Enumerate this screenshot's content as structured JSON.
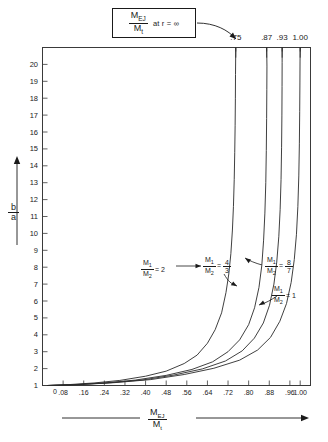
{
  "figure": {
    "callout": {
      "numerator": "M",
      "numerator_sub": "EJ",
      "denominator": "M",
      "denominator_sub": "t",
      "condition": "at  r = ∞"
    },
    "asymptote_labels": [
      ".75",
      ".87",
      ".93",
      "1.00"
    ],
    "y_axis": {
      "label_num": "b",
      "label_den": "a",
      "ticks": [
        "20",
        "19",
        "18",
        "17",
        "16",
        "15",
        "14",
        "13",
        "12",
        "11",
        "10",
        "9",
        "8",
        "7",
        "6",
        "5",
        "4",
        "3",
        "2",
        "1"
      ],
      "origin_label": "0"
    },
    "x_axis": {
      "label_num": "M",
      "label_num_sub": "EJ",
      "label_den": "M",
      "label_den_sub": "t",
      "ticks": [
        ".08",
        ".16",
        ".24",
        ".32",
        ".40",
        ".48",
        ".56",
        ".64",
        ".72",
        ".80",
        ".88",
        ".96",
        "1.00"
      ]
    },
    "annotations": [
      {
        "num": "M",
        "num_sub": "1",
        "den": "M",
        "den_sub": "2",
        "eq": "= 2"
      },
      {
        "num": "M",
        "num_sub": "1",
        "den": "M",
        "den_sub": "2",
        "eq": "= 4/3"
      },
      {
        "num": "M",
        "num_sub": "1",
        "den": "M",
        "den_sub": "2",
        "eq": "= 8/7"
      },
      {
        "num": "M",
        "num_sub": "1",
        "den": "M",
        "den_sub": "2",
        "eq": "= 1"
      }
    ],
    "colors": {
      "ink": "#1a1a1a",
      "background": "#ffffff"
    }
  },
  "chart_data": {
    "type": "line",
    "xlabel": "M_EJ / M_t",
    "ylabel": "b / a",
    "xlim": [
      0,
      1.04
    ],
    "ylim": [
      1,
      21
    ],
    "grid": false,
    "legend": "inline annotations at curves",
    "x_ticks": [
      0.08,
      0.16,
      0.24,
      0.32,
      0.4,
      0.48,
      0.56,
      0.64,
      0.72,
      0.8,
      0.88,
      0.96,
      1.0
    ],
    "y_ticks": [
      1,
      2,
      3,
      4,
      5,
      6,
      7,
      8,
      9,
      10,
      11,
      12,
      13,
      14,
      15,
      16,
      17,
      18,
      19,
      20
    ],
    "series": [
      {
        "name": "M1/M2 = 2",
        "asymptote": 0.75,
        "asymptote_label": ".75",
        "x": [
          0.02,
          0.1,
          0.2,
          0.3,
          0.4,
          0.48,
          0.55,
          0.6,
          0.64,
          0.67,
          0.695,
          0.712,
          0.723,
          0.731,
          0.737,
          0.741,
          0.744,
          0.746,
          0.7475,
          0.7485,
          0.749,
          0.75
        ],
        "y": [
          1.0,
          1.05,
          1.15,
          1.3,
          1.55,
          1.85,
          2.3,
          2.8,
          3.5,
          4.3,
          5.3,
          6.5,
          7.6,
          8.8,
          10.2,
          11.6,
          13.2,
          14.8,
          16.4,
          18.0,
          19.4,
          21.0
        ]
      },
      {
        "name": "M1/M2 = 4/3",
        "asymptote": 0.87,
        "asymptote_label": ".87",
        "x": [
          0.02,
          0.12,
          0.24,
          0.36,
          0.48,
          0.58,
          0.66,
          0.72,
          0.765,
          0.8,
          0.823,
          0.84,
          0.851,
          0.858,
          0.863,
          0.8665,
          0.8685,
          0.8698,
          0.8705,
          0.871,
          0.87
        ],
        "y": [
          1.0,
          1.05,
          1.15,
          1.32,
          1.6,
          1.95,
          2.4,
          3.0,
          3.7,
          4.6,
          5.6,
          6.8,
          8.1,
          9.6,
          11.2,
          13.0,
          14.9,
          16.8,
          18.5,
          19.9,
          21.0
        ]
      },
      {
        "name": "M1/M2 = 8/7",
        "asymptote": 0.93,
        "asymptote_label": ".93",
        "x": [
          0.02,
          0.13,
          0.26,
          0.39,
          0.51,
          0.62,
          0.71,
          0.775,
          0.822,
          0.857,
          0.881,
          0.898,
          0.909,
          0.917,
          0.9222,
          0.9257,
          0.9278,
          0.929,
          0.9296,
          0.9299,
          0.93
        ],
        "y": [
          1.0,
          1.05,
          1.16,
          1.33,
          1.62,
          1.98,
          2.45,
          3.05,
          3.8,
          4.7,
          5.75,
          7.0,
          8.3,
          9.8,
          11.4,
          13.2,
          15.1,
          17.0,
          18.7,
          20.1,
          21.0
        ]
      },
      {
        "name": "M1/M2 = 1",
        "asymptote": 1.0,
        "asymptote_label": "1.00",
        "x": [
          0.02,
          0.14,
          0.28,
          0.42,
          0.55,
          0.665,
          0.765,
          0.835,
          0.885,
          0.921,
          0.947,
          0.965,
          0.977,
          0.9855,
          0.991,
          0.9946,
          0.9968,
          0.9981,
          0.9989,
          0.9994,
          1.0
        ],
        "y": [
          1.0,
          1.05,
          1.17,
          1.35,
          1.65,
          2.02,
          2.5,
          3.1,
          3.85,
          4.8,
          5.85,
          7.1,
          8.45,
          9.95,
          11.6,
          13.4,
          15.3,
          17.2,
          18.9,
          20.2,
          21.0
        ]
      }
    ]
  }
}
